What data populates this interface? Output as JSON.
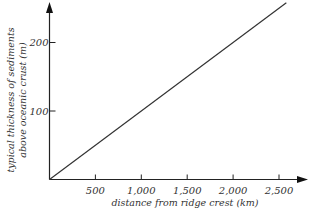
{
  "chart_data": {
    "type": "line",
    "title": "",
    "xlabel": "distance from ridge crest (km)",
    "ylabel_lines": [
      "typical thickness of sediments",
      "above oceanic crust (m)"
    ],
    "ylabel": "typical thickness of sediments above oceanic crust (m)",
    "x_ticks": [
      "500",
      "1,000",
      "1,500",
      "2,000",
      "2,500"
    ],
    "x_tick_values": [
      500,
      1000,
      1500,
      2000,
      2500
    ],
    "y_ticks": [
      "100",
      "200"
    ],
    "y_tick_values": [
      100,
      200
    ],
    "xlim": [
      0,
      2650
    ],
    "ylim": [
      0,
      265
    ],
    "grid": false,
    "legend": null,
    "series": [
      {
        "name": "sediment thickness",
        "x": [
          0,
          2580
        ],
        "y": [
          0,
          258
        ]
      }
    ]
  }
}
